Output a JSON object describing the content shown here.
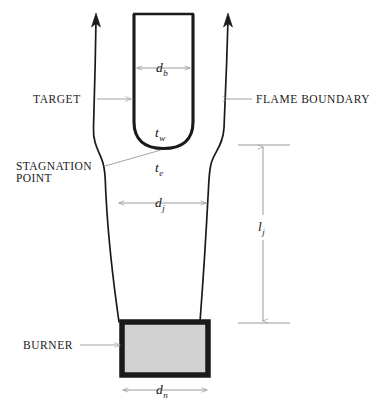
{
  "figure": {
    "type": "schematic-diagram",
    "background_color": "#ffffff",
    "line_color": "#111111",
    "leader_color": "#9a9a9a",
    "burner_fill_color": "#d2d2d2",
    "burner_border_color": "#1a1a1a"
  },
  "callouts": [
    {
      "id": "target",
      "label": "TARGET",
      "anchor": "left",
      "arrow": "right"
    },
    {
      "id": "flame-boundary",
      "label": "FLAME BOUNDARY",
      "anchor": "right",
      "arrow": "left"
    },
    {
      "id": "stagnation-point",
      "label_line1": "STAGNATION",
      "label_line2": "POINT",
      "anchor": "left",
      "arrow": "right-up"
    },
    {
      "id": "burner",
      "label": "BURNER",
      "anchor": "left",
      "arrow": "right"
    }
  ],
  "symbols": [
    {
      "id": "d-b",
      "base": "d",
      "sub": "b",
      "meaning": "target body diameter",
      "dimension": "horizontal"
    },
    {
      "id": "t-w",
      "base": "t",
      "sub": "w",
      "meaning": "wall temperature",
      "dimension": "none"
    },
    {
      "id": "t-e",
      "base": "t",
      "sub": "e",
      "meaning": "edge temperature",
      "dimension": "none"
    },
    {
      "id": "d-j",
      "base": "d",
      "sub": "j",
      "meaning": "jet diameter",
      "dimension": "horizontal"
    },
    {
      "id": "l-j",
      "base": "l",
      "sub": "j",
      "meaning": "jet length",
      "dimension": "vertical"
    },
    {
      "id": "d-n",
      "base": "d",
      "sub": "n",
      "meaning": "nozzle diameter",
      "dimension": "horizontal"
    }
  ],
  "parts": [
    {
      "id": "target-body",
      "name": "target",
      "shape": "u-tube",
      "fill": "none",
      "stroke_width": 3
    },
    {
      "id": "flame-boundary-left",
      "name": "flame boundary left",
      "shape": "curve-with-arrow"
    },
    {
      "id": "flame-boundary-right",
      "name": "flame boundary right",
      "shape": "curve-with-arrow"
    },
    {
      "id": "burner-block",
      "name": "burner",
      "shape": "rectangle",
      "fill": "#d2d2d2"
    }
  ]
}
